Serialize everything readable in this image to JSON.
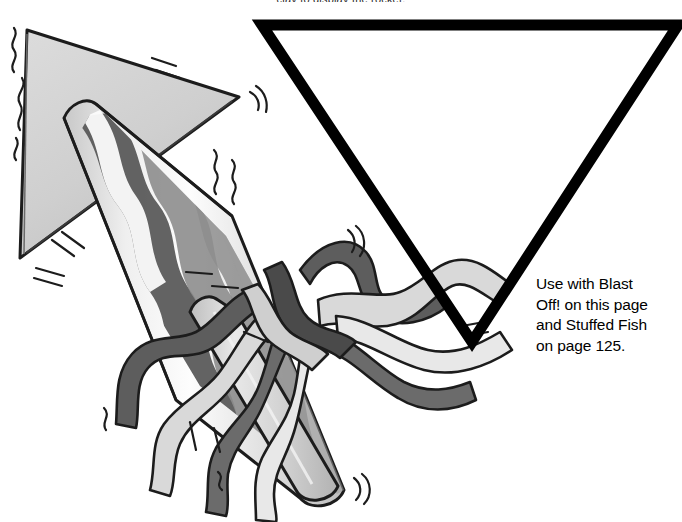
{
  "page": {
    "width": 682,
    "height": 522,
    "background_color": "#ffffff",
    "kind": "craft-book-illustration-page"
  },
  "top_caption": {
    "text": "clay to display the rocket.",
    "clipped": true
  },
  "note": {
    "lines": [
      "Use with Blast",
      "Off! on this page",
      "and Stuffed Fish",
      "on page 125."
    ],
    "full_text": "Use with Blast Off! on this page and Stuffed Fish on page 125.",
    "reference_page_number": "125",
    "color": "#000000"
  },
  "template_shape": {
    "name": "inverted-triangle-template",
    "outline_color": "#000000",
    "stroke_width": 11,
    "fill": "none",
    "points": {
      "top_left": [
        262,
        25
      ],
      "top_right": [
        678,
        25
      ],
      "apex": [
        472,
        342
      ]
    }
  },
  "illustration": {
    "name": "firework-rocket-with-streamers",
    "colors": {
      "outline": "#1a1a1a",
      "fin_light": "#d2d2d2",
      "fin_shade": "#b9b9b9",
      "body_light": "#ececec",
      "body_highlight": "#fbfbfb",
      "body_mid": "#cfcfcf",
      "stripe_mid": "#8d8d8d",
      "stripe_dark": "#585858",
      "streamer_dark": "#6b6b6b",
      "streamer_darker": "#4a4a4a",
      "streamer_light": "#c9c9c9",
      "streamer_pale": "#e2e2e2"
    },
    "parts": [
      "nose-cone-fin",
      "lower-fin",
      "rocket-body",
      "wavy-stripes",
      "streamer-ribbons",
      "motion-lines"
    ]
  }
}
